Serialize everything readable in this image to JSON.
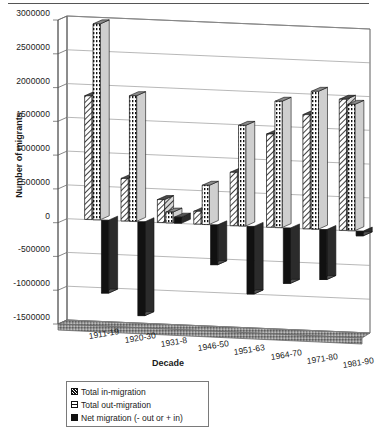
{
  "chart_data": {
    "type": "bar",
    "title": "",
    "xlabel": "Decade",
    "ylabel": "Number of migrants",
    "categories": [
      "1911-19",
      "1920-30",
      "1931-8",
      "1946-50",
      "1951-63",
      "1964-70",
      "1971-80",
      "1981-90"
    ],
    "series": [
      {
        "name": "Total in-migration",
        "values": [
          1830000,
          630000,
          340000,
          190000,
          790000,
          1380000,
          1690000,
          1940000
        ]
      },
      {
        "name": "Total out-migration",
        "values": [
          2900000,
          1860000,
          160000,
          580000,
          1490000,
          1870000,
          2040000,
          1870000
        ]
      },
      {
        "name": "Net migration (- out or + in)",
        "values": [
          -1080000,
          -1390000,
          90000,
          -590000,
          -1000000,
          -820000,
          -740000,
          -70000
        ]
      }
    ],
    "ylim": [
      -1500000,
      3000000
    ],
    "yticks": [
      "3000000",
      "2500000",
      "2000000",
      "1500000",
      "1000000",
      "500000",
      "0",
      "-500000",
      "-1000000",
      "-1500000"
    ],
    "ytick_values": [
      3000000,
      2500000,
      2000000,
      1500000,
      1000000,
      500000,
      0,
      -500000,
      -1000000,
      -1500000
    ],
    "grid": true,
    "legend_position": "bottom-left",
    "style": "3d-clustered-column",
    "colors": {
      "in_migration": "#ffffff",
      "out_migration": "#ffffff",
      "net_migration": "#111111",
      "axis": "#555555",
      "gridline": "#9a9a9a",
      "floor": "#888888"
    }
  },
  "axis": {
    "y_title": "Number of migrants",
    "x_title": "Decade"
  },
  "legend": {
    "items": [
      {
        "label": "Total in-migration",
        "swatch": "hatched-diagonal-swatch"
      },
      {
        "label": "Total out-migration",
        "swatch": "dotted-white-swatch"
      },
      {
        "label": "Net migration (- out or + in)",
        "swatch": "solid-black-swatch"
      }
    ]
  }
}
